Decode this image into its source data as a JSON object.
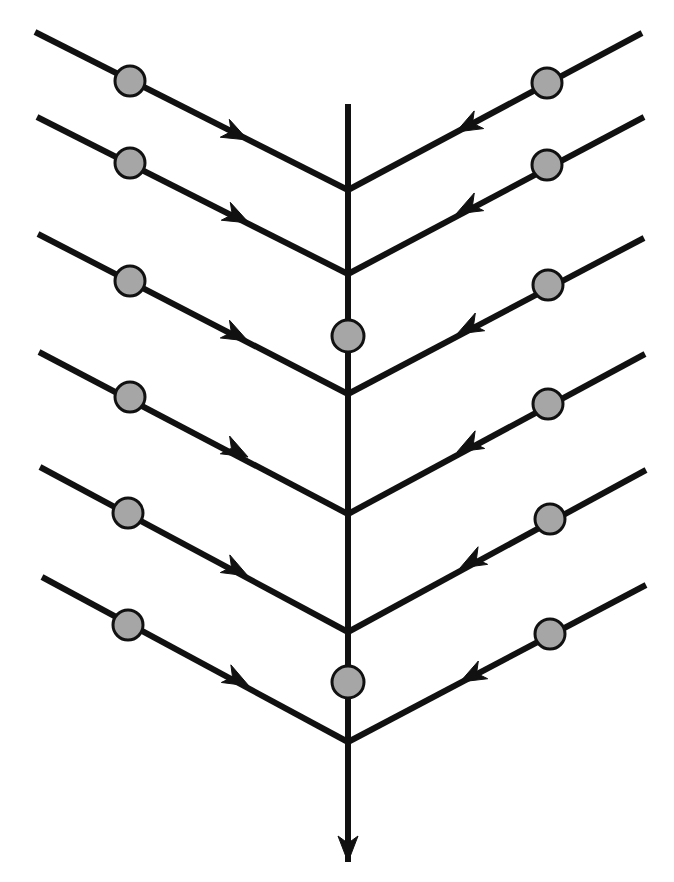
{
  "figure": {
    "kind": "herringbone-diagram",
    "title": "",
    "caption": "",
    "background_color": "#ffffff",
    "canvas": {
      "width": 674,
      "height": 882
    }
  },
  "style": {
    "line_color": "#111111",
    "node_fill_color": "#a6a6a6",
    "node_stroke_color": "#111111",
    "spine_stroke_width": 6,
    "branch_stroke_width": 6,
    "node_radius": 15,
    "node_stroke_width": 3,
    "arrow_length": 26,
    "arrow_half_width": 10
  },
  "spine": {
    "label": "main-spine",
    "direction": "down",
    "x": 348,
    "y_top": 104,
    "y_bottom": 862,
    "arrow_at": "bottom",
    "arrow_tip": {
      "x": 348,
      "y": 862
    },
    "nodes": [
      {
        "id": "spine-node-1",
        "x": 348,
        "y": 336,
        "r": 16
      },
      {
        "id": "spine-node-2",
        "x": 348,
        "y": 682,
        "r": 16
      }
    ],
    "junctions": [
      {
        "id": "junction-1",
        "x": 348,
        "y": 190
      },
      {
        "id": "junction-2",
        "x": 348,
        "y": 394
      },
      {
        "id": "junction-3",
        "x": 348,
        "y": 514
      },
      {
        "id": "junction-4",
        "x": 348,
        "y": 632
      },
      {
        "id": "junction-5",
        "x": 348,
        "y": 742
      }
    ]
  },
  "branches": [
    {
      "id": "left-branch-1",
      "side": "left",
      "start": {
        "x": 35,
        "y": 32
      },
      "end": {
        "x": 348,
        "y": 190
      },
      "node": {
        "x": 130,
        "y": 81,
        "r": 15
      },
      "arrow": {
        "x": 248,
        "y": 140
      },
      "direction": "toward-spine"
    },
    {
      "id": "left-branch-2",
      "side": "left",
      "start": {
        "x": 37,
        "y": 117
      },
      "end": {
        "x": 348,
        "y": 274
      },
      "node": {
        "x": 130,
        "y": 163,
        "r": 15
      },
      "arrow": {
        "x": 249,
        "y": 223
      },
      "direction": "toward-spine"
    },
    {
      "id": "left-branch-3",
      "side": "left",
      "start": {
        "x": 38,
        "y": 234
      },
      "end": {
        "x": 348,
        "y": 394
      },
      "node": {
        "x": 130,
        "y": 281,
        "r": 15
      },
      "arrow": {
        "x": 248,
        "y": 341
      },
      "direction": "toward-spine"
    },
    {
      "id": "left-branch-4",
      "side": "left",
      "start": {
        "x": 39,
        "y": 352
      },
      "end": {
        "x": 348,
        "y": 514
      },
      "node": {
        "x": 130,
        "y": 397,
        "r": 15
      },
      "arrow": {
        "x": 248,
        "y": 457
      },
      "direction": "toward-spine"
    },
    {
      "id": "left-branch-5",
      "side": "left",
      "start": {
        "x": 40,
        "y": 467
      },
      "end": {
        "x": 348,
        "y": 632
      },
      "node": {
        "x": 128,
        "y": 513,
        "r": 15
      },
      "arrow": {
        "x": 248,
        "y": 576
      },
      "direction": "toward-spine"
    },
    {
      "id": "left-branch-6",
      "side": "left",
      "start": {
        "x": 42,
        "y": 577
      },
      "end": {
        "x": 348,
        "y": 742
      },
      "node": {
        "x": 128,
        "y": 625,
        "r": 15
      },
      "arrow": {
        "x": 249,
        "y": 686
      },
      "direction": "toward-spine"
    },
    {
      "id": "right-branch-1",
      "side": "right",
      "start": {
        "x": 642,
        "y": 33
      },
      "end": {
        "x": 348,
        "y": 190
      },
      "node": {
        "x": 547,
        "y": 83,
        "r": 15
      },
      "arrow": {
        "x": 456,
        "y": 132
      },
      "direction": "toward-spine"
    },
    {
      "id": "right-branch-2",
      "side": "right",
      "start": {
        "x": 644,
        "y": 117
      },
      "end": {
        "x": 348,
        "y": 274
      },
      "node": {
        "x": 547,
        "y": 165,
        "r": 15
      },
      "arrow": {
        "x": 456,
        "y": 214
      },
      "direction": "toward-spine"
    },
    {
      "id": "right-branch-3",
      "side": "right",
      "start": {
        "x": 644,
        "y": 238
      },
      "end": {
        "x": 348,
        "y": 394
      },
      "node": {
        "x": 548,
        "y": 285,
        "r": 15
      },
      "arrow": {
        "x": 457,
        "y": 334
      },
      "direction": "toward-spine"
    },
    {
      "id": "right-branch-4",
      "side": "right",
      "start": {
        "x": 645,
        "y": 354
      },
      "end": {
        "x": 348,
        "y": 514
      },
      "node": {
        "x": 548,
        "y": 404,
        "r": 15
      },
      "arrow": {
        "x": 457,
        "y": 452
      },
      "direction": "toward-spine"
    },
    {
      "id": "right-branch-5",
      "side": "right",
      "start": {
        "x": 646,
        "y": 470
      },
      "end": {
        "x": 348,
        "y": 632
      },
      "node": {
        "x": 550,
        "y": 519,
        "r": 15
      },
      "arrow": {
        "x": 460,
        "y": 568
      },
      "direction": "toward-spine"
    },
    {
      "id": "right-branch-6",
      "side": "right",
      "start": {
        "x": 646,
        "y": 585
      },
      "end": {
        "x": 348,
        "y": 742
      },
      "node": {
        "x": 550,
        "y": 634,
        "r": 15
      },
      "arrow": {
        "x": 460,
        "y": 682
      },
      "direction": "toward-spine"
    }
  ],
  "legend": {
    "visible": false,
    "entries": []
  },
  "annotations": []
}
